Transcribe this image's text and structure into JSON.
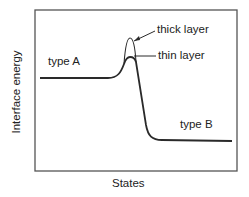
{
  "diagram": {
    "x_axis_label": "States",
    "y_axis_label": "Interface  energy",
    "labels": {
      "type_a": "type A",
      "type_b": "type B",
      "thick_layer": "thick layer",
      "thin_layer": "thin layer"
    },
    "colors": {
      "line": "#2a2a2a",
      "frame": "#555555",
      "background": "#ffffff"
    }
  }
}
